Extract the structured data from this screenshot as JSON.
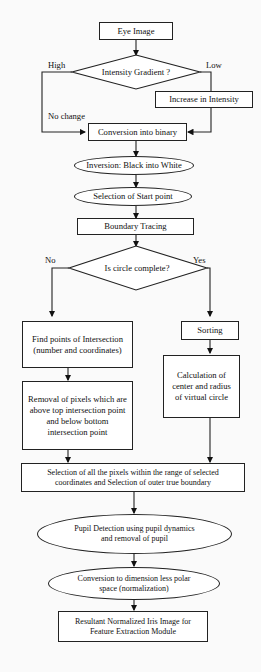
{
  "flowchart": {
    "nodes": {
      "eye_image": "Eye Image",
      "intensity_gradient": "Intensity Gradient ?",
      "increase_intensity": "Increase in Intensity",
      "conversion_binary": "Conversion into binary",
      "inversion": "Inversion: Black into White",
      "start_point": "Selection of Start point",
      "boundary_tracing": "Boundary Tracing",
      "circle_complete": "Is circle complete?",
      "find_points": "Find  points of Intersection (number and coordinates)",
      "sorting": "Sorting",
      "removal_pixels": "Removal  of pixels which are  above top intersection point and below bottom intersection point",
      "calc_center": "Calculation of center and radius of virtual circle",
      "selection_pixels": "Selection of all the pixels  within the range of selected coordinates and Selection of outer true boundary",
      "pupil_detection": "Pupil Detection using pupil dynamics and removal of pupil",
      "conversion_polar": "Conversion to dimension less polar space (normalization)",
      "resultant_iris": "Resultant Normalized Iris Image for Feature Extraction Module"
    },
    "edge_labels": {
      "high": "High",
      "low": "Low",
      "no_change": "No change",
      "no": "No",
      "yes": "Yes"
    }
  }
}
